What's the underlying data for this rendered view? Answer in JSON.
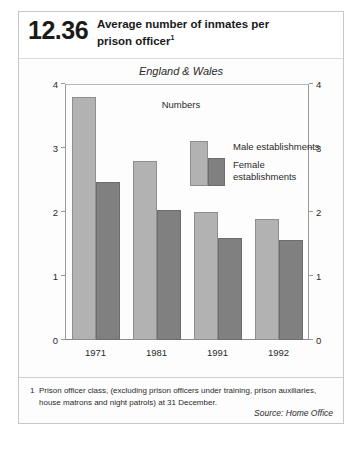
{
  "figure": {
    "number": "12.36",
    "title_line1": "Average number of inmates per",
    "title_line2": "prison officer",
    "title_footnote_marker": "1"
  },
  "chart_data": {
    "type": "bar",
    "title": "Average number of inmates per prison officer",
    "subtitle": "England & Wales",
    "units_label": "Numbers",
    "categories": [
      "1971",
      "1981",
      "1991",
      "1992"
    ],
    "series": [
      {
        "name": "Male establishments",
        "values": [
          3.8,
          2.8,
          2.0,
          1.89
        ],
        "color": "#b2b2b2"
      },
      {
        "name": "Female establishments",
        "values": [
          2.47,
          2.03,
          1.6,
          1.56
        ],
        "color": "#808080"
      }
    ],
    "xlabel": "",
    "ylabel": "",
    "ylim": [
      0,
      4
    ],
    "yticks": [
      0,
      1,
      2,
      3,
      4
    ],
    "ytick_labels_left": [
      "0",
      "1",
      "2",
      "3",
      "4"
    ],
    "ytick_labels_right": [
      "0",
      "1",
      "2",
      "3",
      "4"
    ],
    "grid": false,
    "legend_position": "inside-upper-right",
    "dual_y_axis": true
  },
  "legend": {
    "male_label": "Male establishments",
    "female_label": "Female\nestablishments"
  },
  "footnotes": {
    "marker": "1",
    "text": "Prison officer class, (excluding prison officers under training, prison auxiliaries, house matrons and night  patrols) at 31 December.",
    "source": "Source: Home Office"
  }
}
